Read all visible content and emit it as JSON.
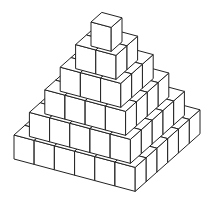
{
  "figure": {
    "layers": [
      6,
      5,
      4,
      3,
      2,
      1
    ],
    "colors": {
      "fill": "#ffffff",
      "stroke": "#222222",
      "background": "#ffffff"
    }
  }
}
